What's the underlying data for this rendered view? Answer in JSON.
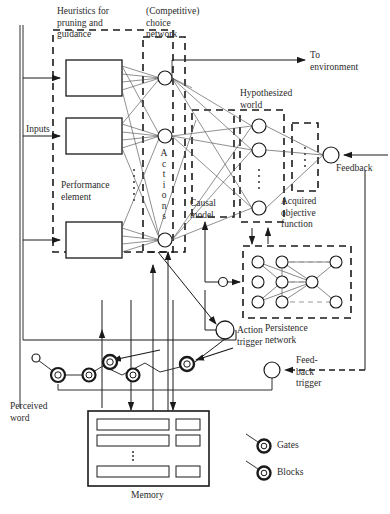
{
  "figure": {
    "type": "block-diagram"
  },
  "labels": {
    "heuristics": "Heuristics for\npruning and\nguidance",
    "competitive": "(Competitive)\nchoice\nnetwork",
    "to_environment": "To\nenvironment",
    "hypothesized_world": "Hypothesized\nworld",
    "inputs": "Inputs",
    "performance_element": "Performance\nelement",
    "actions_vertical": [
      "A",
      "c",
      "t",
      "i",
      "o",
      "n",
      "s"
    ],
    "causal_model": "Causal\nmodel",
    "acquired_objective": "Acquired\nobjective\nfunction",
    "feedback": "Feedback",
    "persistence_network": "Persistence\nnetwork",
    "action_trigger": "Action\ntrigger",
    "feedback_trigger": "Feed-\nback\ntrigger",
    "perceived_word": "Perceived\nword",
    "memory": "Memory"
  },
  "legend": [
    {
      "symbol": "ring-small",
      "label": "Gates"
    },
    {
      "symbol": "ring-small",
      "label": "Blocks"
    }
  ],
  "colors": {
    "stroke": "#1a1a1a",
    "fill": "#ffffff",
    "background": "#ffffff",
    "text": "#2a2a2a"
  },
  "counts": {
    "performance_boxes": 3,
    "action_nodes": 3,
    "hypothesized_nodes": 3,
    "persistence_nodes": 9,
    "memory_rows": 3,
    "gates_row": 5
  }
}
